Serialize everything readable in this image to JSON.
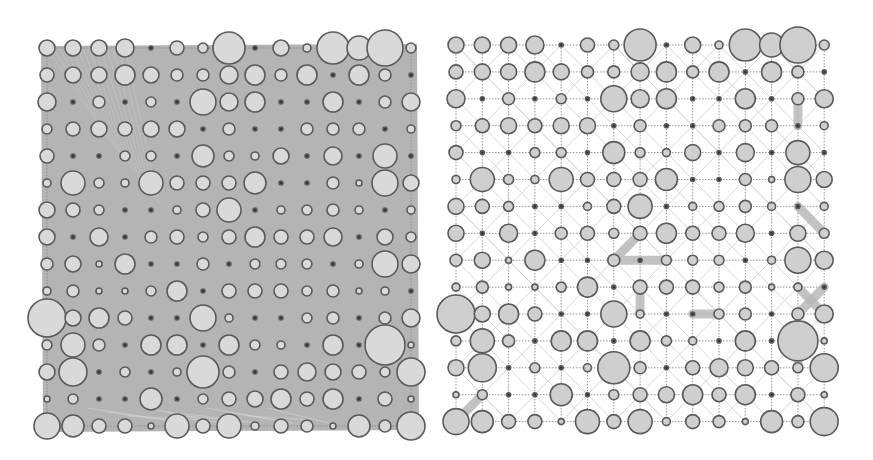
{
  "figure": {
    "panels": [
      {
        "id": "left",
        "description": "grid graph nodes over dense shaded edge mass",
        "background_fill": "#b4b4b4",
        "node_fill": "#d9d9d9",
        "origin": [
          47,
          48
        ],
        "spacing": [
          26.0,
          27.0
        ]
      },
      {
        "id": "right",
        "description": "grid graph nodes with dotted lattice edges, faint diagonals and a few highlighted thick edges",
        "background_fill": "#ffffff",
        "node_fill": "#cfcfcf",
        "origin": [
          456,
          45
        ],
        "spacing": [
          26.3,
          26.9
        ]
      }
    ],
    "grid_size": [
      15,
      15
    ],
    "node_radii": [
      [
        8,
        8,
        8,
        9,
        2,
        7,
        5,
        16,
        2,
        8,
        4,
        16,
        12,
        18,
        5
      ],
      [
        7,
        8,
        8,
        10,
        8,
        6,
        6,
        9,
        10,
        6,
        10,
        2,
        10,
        6,
        2
      ],
      [
        9,
        2,
        6,
        2,
        5,
        2,
        13,
        9,
        10,
        2,
        2,
        10,
        2,
        6,
        9
      ],
      [
        5,
        7,
        8,
        7,
        8,
        8,
        2,
        6,
        2,
        2,
        6,
        6,
        6,
        2,
        4
      ],
      [
        7,
        2,
        2,
        5,
        5,
        2,
        11,
        5,
        4,
        8,
        2,
        9,
        2,
        12,
        2
      ],
      [
        4,
        12,
        5,
        4,
        12,
        7,
        7,
        7,
        11,
        2,
        2,
        6,
        3,
        13,
        8
      ],
      [
        8,
        7,
        5,
        2,
        2,
        4,
        7,
        12,
        2,
        4,
        5,
        6,
        4,
        2,
        4
      ],
      [
        8,
        2,
        9,
        2,
        6,
        7,
        5,
        7,
        10,
        7,
        7,
        9,
        2,
        8,
        5
      ],
      [
        6,
        8,
        3,
        10,
        2,
        2,
        6,
        2,
        5,
        5,
        5,
        2,
        4,
        13,
        9
      ],
      [
        4,
        6,
        3,
        3,
        5,
        10,
        2,
        7,
        7,
        7,
        5,
        6,
        3,
        4,
        2
      ],
      [
        19,
        8,
        10,
        7,
        2,
        2,
        13,
        4,
        2,
        2,
        5,
        6,
        2,
        6,
        9
      ],
      [
        5,
        12,
        6,
        2,
        10,
        10,
        2,
        10,
        5,
        4,
        2,
        10,
        2,
        20,
        3
      ],
      [
        8,
        14,
        2,
        5,
        2,
        4,
        16,
        6,
        2,
        7,
        9,
        8,
        7,
        5,
        14
      ],
      [
        3,
        5,
        2,
        2,
        11,
        2,
        5,
        7,
        8,
        10,
        7,
        10,
        2,
        7,
        3
      ],
      [
        13,
        11,
        7,
        7,
        3,
        12,
        7,
        12,
        4,
        7,
        6,
        3,
        11,
        6,
        14
      ]
    ],
    "right_thick_edges": [
      [
        [
          2,
          13
        ],
        [
          3,
          13
        ]
      ],
      [
        [
          6,
          13
        ],
        [
          7,
          14
        ]
      ],
      [
        [
          7,
          7
        ],
        [
          8,
          6
        ]
      ],
      [
        [
          8,
          6
        ],
        [
          8,
          8
        ]
      ],
      [
        [
          9,
          7
        ],
        [
          10,
          7
        ]
      ],
      [
        [
          10,
          9
        ],
        [
          10,
          10
        ]
      ],
      [
        [
          9,
          14
        ],
        [
          10,
          13
        ]
      ],
      [
        [
          9,
          13
        ],
        [
          10,
          14
        ]
      ],
      [
        [
          11,
          13
        ],
        [
          12,
          13
        ]
      ],
      [
        [
          13,
          1
        ],
        [
          14,
          0
        ]
      ]
    ]
  }
}
